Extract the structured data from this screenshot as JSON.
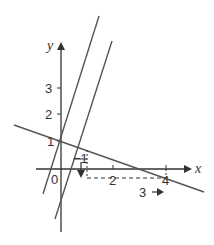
{
  "diagram": {
    "axes": {
      "x_label": "x",
      "y_label": "y",
      "origin_label": "0",
      "x_ticks": [
        {
          "value": 2,
          "label": "2"
        },
        {
          "value": 4,
          "label": "4"
        }
      ],
      "y_ticks": [
        {
          "value": 1,
          "label": "1"
        },
        {
          "value": 2,
          "label": "2"
        },
        {
          "value": 3,
          "label": "3"
        }
      ]
    },
    "lines": [
      {
        "id": "shallow-line",
        "description": "decreasing line through (0,1) and (4,-0.5)"
      },
      {
        "id": "steep-line-1",
        "description": "steep increasing line through (0,1.2)"
      },
      {
        "id": "steep-line-2",
        "description": "steep increasing line parallel to steep-line-1"
      }
    ],
    "annotations": {
      "slope_triangle_run": "1",
      "slope_triangle_drop": "−1",
      "run_label": "3",
      "run_arrow": "→"
    },
    "colors": {
      "line": "#555555",
      "axis": "#333333",
      "text": "#333333"
    }
  }
}
